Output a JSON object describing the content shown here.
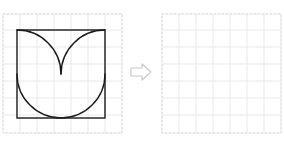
{
  "page": {
    "background_color": "#ffffff",
    "width": 284,
    "height": 144
  },
  "style": {
    "grid_line_color": "#e9e9e9",
    "grid_border_color": "#dcdcdc",
    "shape_stroke_color": "#1a1a1a",
    "arrow_stroke_color": "#c9c9c9",
    "arrow_fill_color": "#ffffff"
  },
  "panels": [
    {
      "id": "source-panel",
      "name": "left-grid-panel",
      "label": "",
      "grid": {
        "columns": 7,
        "rows": 7,
        "cell_size": 17,
        "origin_x": 1,
        "origin_y": 0,
        "width": 119,
        "height": 119,
        "dashed_border": true
      },
      "shape": {
        "name": "tulip-in-square",
        "description": "Square outline with one large inscribed circle arc and two opposing corner arcs forming a tulip",
        "square": {
          "x": 15,
          "y": 16,
          "width": 88,
          "height": 88
        },
        "elements": [
          {
            "type": "square-outline",
            "name": "bounding-square"
          },
          {
            "type": "circle-arc",
            "name": "lower-bowl-arc",
            "cx": 59,
            "cy": 60,
            "r": 44
          },
          {
            "type": "quarter-arc",
            "name": "upper-left-petal-arc",
            "from": "top-left-corner",
            "to": "center-cusp"
          },
          {
            "type": "quarter-arc",
            "name": "upper-right-petal-arc",
            "from": "top-right-corner",
            "to": "center-cusp"
          }
        ],
        "cusp_point": {
          "x": 59,
          "y": 60
        }
      }
    },
    {
      "id": "target-panel",
      "name": "right-grid-panel",
      "label": "",
      "grid": {
        "columns": 7,
        "rows": 7,
        "cell_size": 17,
        "origin_x": 1,
        "origin_y": 0,
        "width": 119,
        "height": 119,
        "dashed_border": true
      },
      "shape": null,
      "empty": true
    }
  ],
  "arrow": {
    "name": "transform-arrow",
    "direction": "right",
    "style": "hollow-outline",
    "label": ""
  }
}
